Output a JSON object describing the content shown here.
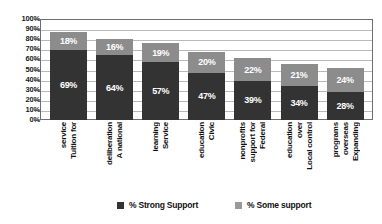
{
  "chart_data": {
    "type": "bar",
    "subtype": "stacked-column",
    "title": "",
    "xlabel": "",
    "ylabel": "",
    "ylim": [
      0,
      100
    ],
    "yticks": [
      "0%",
      "10%",
      "20%",
      "30%",
      "40%",
      "50%",
      "60%",
      "70%",
      "80%",
      "90%",
      "100%"
    ],
    "grid": true,
    "legend_position": "bottom",
    "categories": [
      "Tuition for service",
      "A national deliberation",
      "Service learning",
      "Civic education",
      "Federal support for nonprofits",
      "Local control over education",
      "Expanding overseas programs"
    ],
    "category_lines": [
      [
        "Tuition for",
        "service"
      ],
      [
        "A national",
        "deliberation"
      ],
      [
        "Service",
        "learning"
      ],
      [
        "Civic",
        "education"
      ],
      [
        "Federal",
        "support for",
        "nonprofits"
      ],
      [
        "Local control",
        "over",
        "education"
      ],
      [
        "Expanding",
        "overseas",
        "programs"
      ]
    ],
    "series": [
      {
        "name": "% Strong Support",
        "color": "#333333",
        "values": [
          69,
          64,
          57,
          47,
          39,
          34,
          28
        ],
        "labels": [
          "69%",
          "64%",
          "57%",
          "47%",
          "39%",
          "34%",
          "28%"
        ]
      },
      {
        "name": "% Some support",
        "color": "#8c8c8c",
        "values": [
          18,
          16,
          19,
          20,
          22,
          21,
          24
        ],
        "labels": [
          "18%",
          "16%",
          "19%",
          "20%",
          "22%",
          "21%",
          "24%"
        ]
      }
    ]
  },
  "legend": {
    "items": [
      {
        "label": "% Strong Support",
        "color": "#333333"
      },
      {
        "label": "% Some support",
        "color": "#9a9a9a"
      }
    ]
  }
}
